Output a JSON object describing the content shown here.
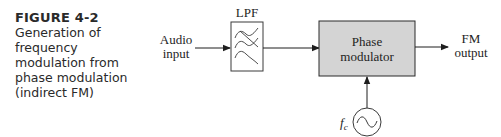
{
  "caption": {
    "figure_number": "FIGURE 4-2",
    "title": "Generation of frequency modulation from phase modulation (indirect FM)"
  },
  "diagram": {
    "input": {
      "line1": "Audio",
      "line2": "input"
    },
    "lpf": {
      "label": "LPF",
      "icon": "filter-waves-icon"
    },
    "modulator": {
      "line1": "Phase",
      "line2": "modulator",
      "fill": "#d4d4d4",
      "border": "#2a2a2a"
    },
    "output": {
      "line1": "FM",
      "line2": "output"
    },
    "oscillator": {
      "label": "f",
      "subscript": "c",
      "icon": "sine-source-icon"
    },
    "connections": [
      "Audio input -> LPF",
      "LPF -> Phase modulator",
      "Phase modulator -> FM output",
      "Oscillator fc -> Phase modulator"
    ]
  }
}
